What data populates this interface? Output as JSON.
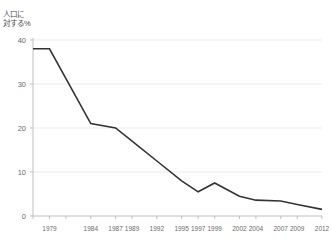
{
  "meta": {
    "clipped_header_text": "",
    "background_color": "#ffffff",
    "line_color": "#333333",
    "grid_color": "#ebebeb",
    "axis_color": "#bfbfbf",
    "text_color": "#6a6a6a"
  },
  "chart_data": {
    "type": "line",
    "title": "",
    "xlabel": "",
    "ylabel": "人口に\n対する%",
    "ylabel_lines": [
      "人口に",
      "対する%"
    ],
    "ylim": [
      0,
      40
    ],
    "xlim": [
      1977,
      2012
    ],
    "grid": true,
    "legend": "none",
    "y_ticks": [
      40,
      30,
      20,
      10,
      0
    ],
    "y_tick_labels": [
      "40",
      "30",
      "20",
      "10",
      "0"
    ],
    "x_tick_years": [
      1977,
      1979,
      1981,
      1984,
      1987,
      1989,
      1992,
      1995,
      1997,
      1999,
      2002,
      2004,
      2007,
      2009,
      2012
    ],
    "x_tick_labels": [
      "",
      "1979",
      "",
      "1984",
      "1987",
      "1989",
      "1992",
      "1995",
      "1997",
      "1999",
      "2002",
      "2004",
      "2007",
      "2009",
      "2012"
    ],
    "series": [
      {
        "name": "人口に対する%",
        "x": [
          1977,
          1979,
          1984,
          1987,
          1989,
          1992,
          1995,
          1997,
          1999,
          2002,
          2004,
          2007,
          2009,
          2012
        ],
        "values": [
          38.0,
          38.0,
          21.0,
          20.0,
          17.0,
          12.5,
          8.0,
          5.5,
          7.5,
          4.5,
          3.6,
          3.4,
          2.6,
          1.5
        ]
      }
    ]
  }
}
